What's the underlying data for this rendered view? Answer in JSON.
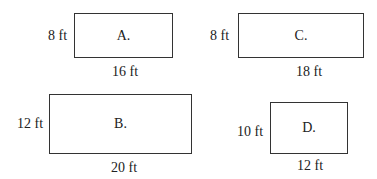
{
  "shapes": [
    {
      "id": "A",
      "label": "A.",
      "height_label": "8 ft",
      "width_label": "16 ft"
    },
    {
      "id": "B",
      "label": "B.",
      "height_label": "12 ft",
      "width_label": "20 ft"
    },
    {
      "id": "C",
      "label": "C.",
      "height_label": "8 ft",
      "width_label": "18 ft"
    },
    {
      "id": "D",
      "label": "D.",
      "height_label": "10 ft",
      "width_label": "12 ft"
    }
  ]
}
